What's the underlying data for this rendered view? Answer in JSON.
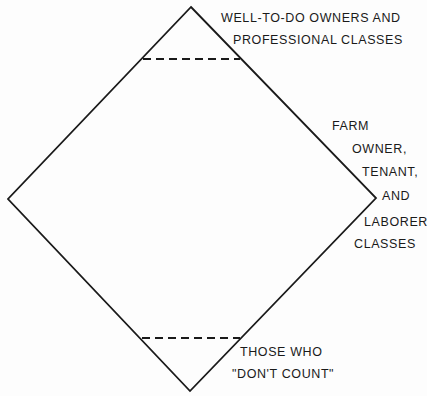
{
  "diagram": {
    "shape": "diamond",
    "stroke_color": "#1a1a1a",
    "background": "#fdfdfd",
    "vertices": {
      "top": [
        191,
        7
      ],
      "right": [
        376,
        198
      ],
      "bottom": [
        190,
        391
      ],
      "left": [
        8,
        199
      ]
    },
    "dividers": [
      {
        "name": "upper-divider",
        "style": "dashed",
        "y": 59,
        "x1": 143,
        "x2": 240
      },
      {
        "name": "lower-divider",
        "style": "dashed",
        "y": 338,
        "x1": 142,
        "x2": 240
      }
    ]
  },
  "labels": {
    "top": {
      "line1": "WELL-TO-DO OWNERS AND",
      "line2": "PROFESSIONAL CLASSES"
    },
    "middle": {
      "line1": "FARM",
      "line2": "OWNER,",
      "line3": "TENANT,",
      "line4": "AND",
      "line5": "LABORER",
      "line6": "CLASSES"
    },
    "bottom": {
      "line1": "THOSE WHO",
      "line2": "\"DON'T COUNT\""
    }
  }
}
